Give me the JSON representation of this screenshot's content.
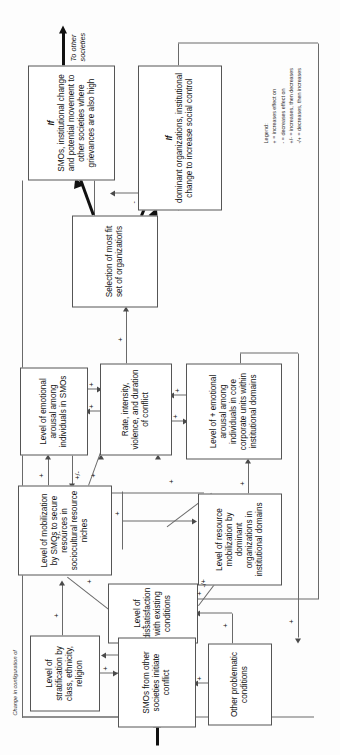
{
  "figure": {
    "orientation": "rotated-90-ccw",
    "config_label": "Change in configuration of",
    "outflow_label": "To other\nsocieties"
  },
  "legend": {
    "title": "Legend:",
    "entries": [
      "+  =  increases effect on",
      "-   =  decreases effect on",
      "+/- =  increases, then decreases",
      "-/+ =  decreases, then increases"
    ]
  },
  "nodes": [
    {
      "id": "smos_inst_change",
      "prefix": "If",
      "label": "SMOs, institutional change and potential movement to other societies where grievances are also high"
    },
    {
      "id": "dominant_orgs",
      "prefix": "If",
      "label": "dominant organizations, institutional change to increase social control"
    },
    {
      "id": "selection",
      "prefix": "",
      "label": "Selection of most fit set of organizations"
    },
    {
      "id": "emo_smos",
      "prefix": "",
      "label": "Level of emotional arousal among individuals in SMOs"
    },
    {
      "id": "conflict",
      "prefix": "",
      "label": "Rate, intensity, violence, and duration of conflict"
    },
    {
      "id": "emo_core",
      "prefix": "",
      "label": "Level of + emotional arousal among individuals in core corporate units within institutional domains"
    },
    {
      "id": "mobilization_smos",
      "prefix": "",
      "label": "Level of mobilization by SMOs to secure resources in sociocultural resource niches"
    },
    {
      "id": "resource_mob_dom",
      "prefix": "",
      "label": "Level of resource mobilization by dominant organizations in institutional domains"
    },
    {
      "id": "dissatisfaction",
      "prefix": "",
      "label": "Level of dissatisfaction with existing conditions"
    },
    {
      "id": "stratification",
      "prefix": "",
      "label": "Level of stratification by class, ethnicity, religion"
    },
    {
      "id": "smos_other",
      "prefix": "",
      "label": "SMOs from other societies initiate conflict"
    },
    {
      "id": "other_problems",
      "prefix": "",
      "label": "Other problematic conditions"
    }
  ],
  "signs": {
    "plus": "+",
    "minus": "-",
    "plus_minus": "+/-",
    "minus_plus": "-/+"
  },
  "edge_signs": [
    {
      "from": "dominant_orgs",
      "to": "smos_inst_change",
      "sign": "-"
    },
    {
      "from": "smos_inst_change",
      "to": "dominant_orgs",
      "sign": "-"
    },
    {
      "from": "conflict",
      "to": "selection",
      "sign": "+"
    },
    {
      "from": "conflict",
      "to": "emo_smos",
      "sign": "+"
    },
    {
      "from": "emo_smos",
      "to": "conflict",
      "sign": "+"
    },
    {
      "from": "conflict",
      "to": "emo_core",
      "sign": "+"
    },
    {
      "from": "emo_core",
      "to": "conflict",
      "sign": "+"
    },
    {
      "from": "mobilization_smos",
      "to": "emo_smos",
      "sign": "+"
    },
    {
      "from": "emo_smos",
      "to": "mobilization_smos",
      "sign": "+/-"
    },
    {
      "from": "mobilization_smos",
      "to": "conflict",
      "sign": "+"
    },
    {
      "from": "resource_mob_dom",
      "to": "conflict",
      "sign": "+"
    },
    {
      "from": "resource_mob_dom",
      "to": "emo_core",
      "sign": "+"
    },
    {
      "from": "resource_mob_dom",
      "to": "mobilization_smos",
      "sign": "+/-"
    },
    {
      "from": "dissatisfaction",
      "to": "mobilization_smos",
      "sign": "+"
    },
    {
      "from": "mobilization_smos",
      "to": "resource_mob_dom",
      "sign": "+"
    },
    {
      "from": "dissatisfaction",
      "to": "resource_mob_dom",
      "sign": "-/+"
    },
    {
      "from": "stratification",
      "to": "dissatisfaction",
      "sign": "+"
    },
    {
      "from": "stratification",
      "to": "smos_other",
      "sign": "+"
    },
    {
      "from": "smos_other",
      "to": "dissatisfaction",
      "sign": "+"
    },
    {
      "from": "other_problems",
      "to": "smos_other",
      "sign": "+"
    },
    {
      "from": "other_problems",
      "to": "dissatisfaction",
      "sign": "+"
    },
    {
      "from": "dissatisfaction",
      "to": "other_problems",
      "sign": "+"
    },
    {
      "from": "dominant_orgs",
      "to": "dissatisfaction",
      "sign": "+"
    },
    {
      "from": "smos_inst_change",
      "to": "dissatisfaction",
      "sign": "+"
    },
    {
      "from": "emo_core",
      "to": "other_problems",
      "sign": "+"
    }
  ]
}
